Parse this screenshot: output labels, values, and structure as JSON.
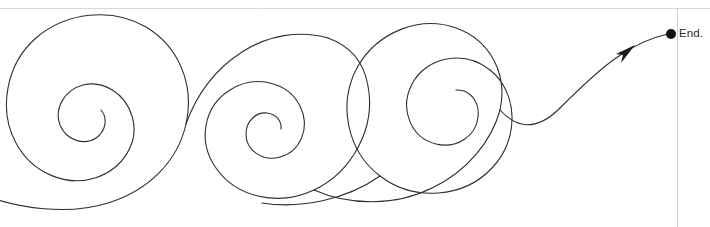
{
  "page": {
    "width": 710,
    "height": 227,
    "background_color": "#ffffff",
    "top_rule": {
      "name": "top-horizontal-rule",
      "y": 8,
      "x1": 0,
      "x2": 710,
      "color": "#d8d8d8",
      "width": 1
    },
    "right_border": {
      "name": "page-right-border",
      "x": 677,
      "y1": 8,
      "y2": 227,
      "color": "#cfcfcf",
      "width": 1
    }
  },
  "drawing": {
    "title": "spiral-path-illustration",
    "stroke_color": "#2f2f2f",
    "stroke_width": 1.1,
    "fill": "none",
    "description": "Hand-drawn style continuous path sweeping left to right through three inward spirals, rising to an arrowhead and a terminal dot.",
    "path_d": "M -20 215 C 30 232 95 228 135 205 C 186 176 196 120 178 82 C 162 47 118 26 78 32 C 38 38 12 72 16 108 C 20 142 50 164 78 160 C 104 157 120 134 115 112 C 110 92 92 80 78 84 C 64 88 58 103 64 114 C 70 125 84 128 92 122 C 99 117 100 108 96 103",
    "spirals": [
      {
        "name": "spiral-1",
        "center_x": 88,
        "center_y": 112,
        "outer_radius": 96,
        "inner_radius": 22,
        "direction": "counter-clockwise-inward"
      },
      {
        "name": "spiral-2",
        "center_x": 272,
        "center_y": 140,
        "outer_radius": 68,
        "inner_radius": 18,
        "direction": "counter-clockwise-inward"
      },
      {
        "name": "spiral-3",
        "center_x": 512,
        "center_y": 110,
        "outer_radius": 94,
        "inner_radius": 22,
        "direction": "counter-clockwise-inward"
      }
    ],
    "arrow_head": {
      "name": "arrow-head",
      "x": 633,
      "y": 48,
      "angle_deg": -40,
      "color": "#1a1a1a"
    },
    "end_dot": {
      "name": "end-point-dot",
      "cx": 671,
      "cy": 34,
      "r": 5,
      "color": "#111111"
    }
  },
  "labels": {
    "end": "End."
  }
}
